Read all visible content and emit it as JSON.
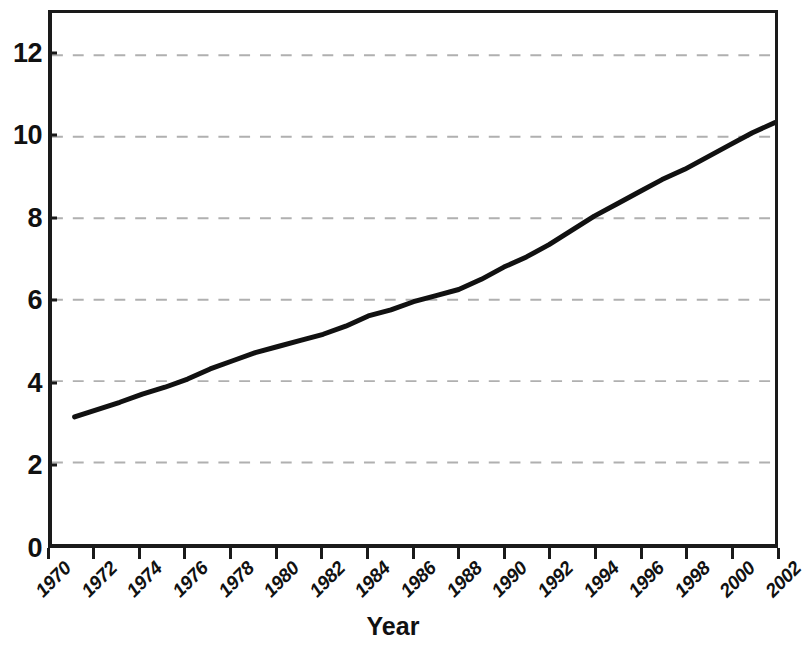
{
  "chart_data": {
    "type": "line",
    "title": "",
    "subtitle": "",
    "xlabel": "Year",
    "ylabel": "",
    "xlim": [
      1970,
      2002
    ],
    "ylim": [
      0,
      13.04
    ],
    "grid": true,
    "grid_axis": "y",
    "grid_style": "dashed",
    "legend": false,
    "legend_position": "none",
    "x_tick_labels": [
      "1970",
      "1972",
      "1974",
      "1976",
      "1978",
      "1980",
      "1982",
      "1984",
      "1986",
      "1988",
      "1990",
      "1992",
      "1994",
      "1996",
      "1998",
      "2000",
      "2002"
    ],
    "x_tick_values": [
      1970,
      1972,
      1974,
      1976,
      1978,
      1980,
      1982,
      1984,
      1986,
      1988,
      1990,
      1992,
      1994,
      1996,
      1998,
      2000,
      2002
    ],
    "y_tick_labels": [
      "0",
      "2",
      "4",
      "6",
      "8",
      "10",
      "12"
    ],
    "y_tick_values": [
      0,
      2,
      4,
      6,
      8,
      10,
      12
    ],
    "series": [
      {
        "name": "value",
        "color": "#111111",
        "line_width": 5,
        "x": [
          1971,
          1972,
          1973,
          1974,
          1975,
          1976,
          1977,
          1978,
          1979,
          1980,
          1981,
          1982,
          1983,
          1984,
          1985,
          1986,
          1987,
          1988,
          1989,
          1990,
          1991,
          1992,
          1993,
          1994,
          1995,
          1996,
          1997,
          1998,
          1999,
          2000,
          2001,
          2002
        ],
        "values": [
          3.12,
          3.3,
          3.48,
          3.68,
          3.85,
          4.05,
          4.3,
          4.5,
          4.7,
          4.85,
          5.0,
          5.15,
          5.35,
          5.6,
          5.75,
          5.95,
          6.1,
          6.25,
          6.5,
          6.8,
          7.05,
          7.35,
          7.7,
          8.05,
          8.35,
          8.65,
          8.95,
          9.2,
          9.5,
          9.8,
          10.1,
          10.35
        ]
      }
    ]
  },
  "axis": {
    "x_title": "Year"
  },
  "colors": {
    "line": "#111111",
    "grid": "#b0b0b0",
    "frame": "#1a1a1a",
    "background": "#ffffff",
    "text": "#111111"
  }
}
